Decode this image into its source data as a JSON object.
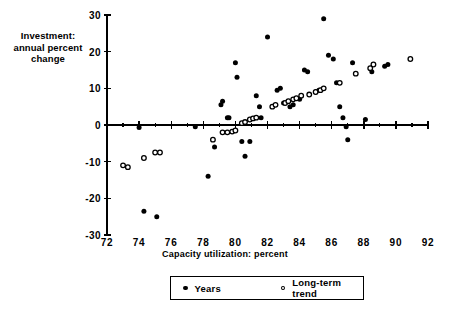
{
  "chart_data": {
    "type": "scatter",
    "title": "",
    "xlabel": "Capacity utilization: percent",
    "ylabel": "Investment:\nannual percent\nchange",
    "xlim": [
      72,
      92
    ],
    "ylim": [
      -30,
      30
    ],
    "xticks": [
      72,
      74,
      76,
      78,
      80,
      82,
      84,
      86,
      88,
      90,
      92
    ],
    "xtick_labels": [
      "72",
      "74",
      "76",
      "78",
      "80",
      "82",
      "84",
      "86",
      "88",
      "90",
      "92"
    ],
    "yticks": [
      -30,
      -20,
      -10,
      0,
      10,
      20,
      30
    ],
    "ytick_labels": [
      "-30",
      "-20",
      "-10",
      "0",
      "10",
      "20",
      "30"
    ],
    "minor_xticks": [
      73,
      75,
      77,
      79,
      81,
      83,
      85,
      87,
      89,
      91
    ],
    "grid": false,
    "legend_position": "below-center",
    "series": [
      {
        "name": "Years",
        "marker": "filled-circle",
        "color": "#000000",
        "points": [
          [
            74.3,
            -23.5
          ],
          [
            75.1,
            -25.0
          ],
          [
            74.0,
            -0.7
          ],
          [
            77.5,
            -0.5
          ],
          [
            78.3,
            -14.0
          ],
          [
            78.7,
            -6.0
          ],
          [
            79.1,
            5.5
          ],
          [
            79.2,
            6.5
          ],
          [
            79.5,
            2.0
          ],
          [
            79.6,
            2.0
          ],
          [
            80.0,
            17.0
          ],
          [
            80.1,
            13.0
          ],
          [
            80.4,
            -4.5
          ],
          [
            80.6,
            -8.5
          ],
          [
            80.9,
            -4.5
          ],
          [
            81.3,
            8.0
          ],
          [
            81.5,
            5.0
          ],
          [
            81.6,
            2.0
          ],
          [
            82.0,
            24.0
          ],
          [
            82.6,
            9.5
          ],
          [
            82.8,
            10.0
          ],
          [
            83.0,
            6.0
          ],
          [
            83.4,
            5.0
          ],
          [
            83.6,
            5.5
          ],
          [
            84.0,
            7.0
          ],
          [
            84.3,
            15.0
          ],
          [
            84.5,
            14.5
          ],
          [
            85.0,
            9.0
          ],
          [
            85.2,
            9.5
          ],
          [
            85.5,
            29.0
          ],
          [
            85.8,
            19.0
          ],
          [
            86.1,
            18.0
          ],
          [
            86.3,
            11.5
          ],
          [
            86.5,
            5.0
          ],
          [
            86.7,
            2.0
          ],
          [
            86.9,
            -0.5
          ],
          [
            87.0,
            -4.0
          ],
          [
            87.3,
            17.0
          ],
          [
            88.1,
            1.5
          ],
          [
            88.5,
            14.5
          ],
          [
            89.3,
            16.0
          ],
          [
            89.5,
            16.5
          ]
        ]
      },
      {
        "name": "Long-term trend",
        "marker": "open-circle",
        "color": "#000000",
        "points": [
          [
            73.0,
            -11.0
          ],
          [
            73.3,
            -11.5
          ],
          [
            74.3,
            -9.0
          ],
          [
            75.0,
            -7.5
          ],
          [
            75.3,
            -7.5
          ],
          [
            78.6,
            -4.0
          ],
          [
            79.2,
            -2.0
          ],
          [
            79.5,
            -2.0
          ],
          [
            79.8,
            -1.8
          ],
          [
            80.0,
            -1.5
          ],
          [
            80.4,
            0.5
          ],
          [
            80.6,
            0.8
          ],
          [
            80.9,
            1.5
          ],
          [
            81.1,
            1.8
          ],
          [
            81.3,
            2.0
          ],
          [
            82.3,
            5.0
          ],
          [
            82.5,
            5.5
          ],
          [
            83.1,
            6.0
          ],
          [
            83.3,
            6.5
          ],
          [
            83.6,
            7.0
          ],
          [
            83.8,
            7.3
          ],
          [
            84.1,
            8.0
          ],
          [
            84.6,
            8.3
          ],
          [
            85.0,
            9.0
          ],
          [
            85.3,
            9.5
          ],
          [
            85.5,
            10.0
          ],
          [
            86.5,
            11.5
          ],
          [
            87.5,
            14.0
          ],
          [
            88.4,
            15.5
          ],
          [
            88.6,
            16.5
          ],
          [
            90.9,
            18.0
          ]
        ]
      }
    ]
  },
  "legend": {
    "entries": [
      {
        "label": "Years",
        "marker": "filled-circle"
      },
      {
        "label": "Long-term trend",
        "marker": "open-circle"
      }
    ]
  }
}
